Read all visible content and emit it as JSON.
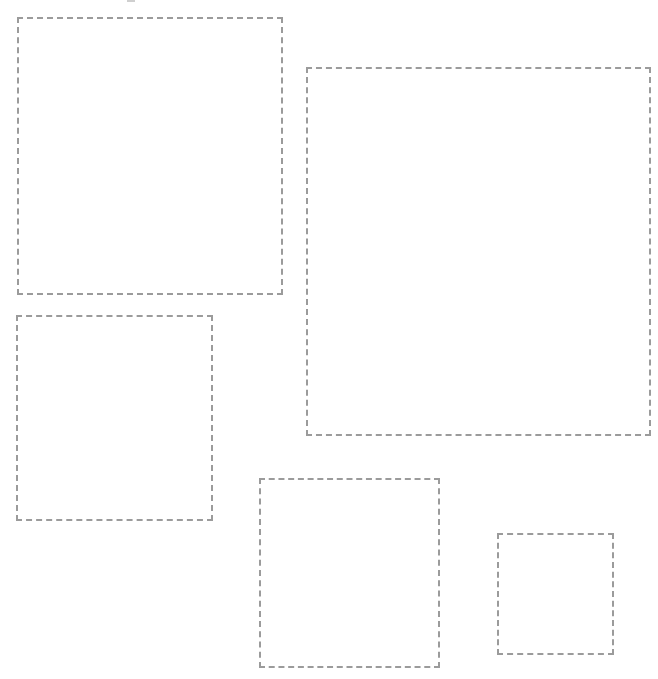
{
  "canvas": {
    "width": 658,
    "height": 679,
    "background_color": "#ffffff",
    "title": "Dashed placeholder regions"
  },
  "style": {
    "border_color": "#9b9b9b",
    "border_width_px": 2,
    "border_style": "dashed",
    "dash_length_px": 6,
    "dash_gap_px": 5,
    "fill": "transparent"
  },
  "regions": [
    {
      "name": "region-1",
      "label": "",
      "x": 17,
      "y": 17,
      "width": 266,
      "height": 278,
      "border_color": "#9b9b9b",
      "border_width_px": 2
    },
    {
      "name": "region-2",
      "label": "",
      "x": 306,
      "y": 67,
      "width": 345,
      "height": 369,
      "border_color": "#9b9b9b",
      "border_width_px": 2
    },
    {
      "name": "region-3",
      "label": "",
      "x": 16,
      "y": 315,
      "width": 197,
      "height": 206,
      "border_color": "#9b9b9b",
      "border_width_px": 2
    },
    {
      "name": "region-4",
      "label": "",
      "x": 259,
      "y": 478,
      "width": 181,
      "height": 190,
      "border_color": "#9b9b9b",
      "border_width_px": 2
    },
    {
      "name": "region-5",
      "label": "",
      "x": 497,
      "y": 533,
      "width": 117,
      "height": 122,
      "border_color": "#9b9b9b",
      "border_width_px": 2
    }
  ],
  "artifacts": [
    {
      "name": "top-edge-dash-artifact",
      "x": 127,
      "y": 0,
      "width": 8,
      "height": 2,
      "color": "#cfcfcf"
    }
  ]
}
